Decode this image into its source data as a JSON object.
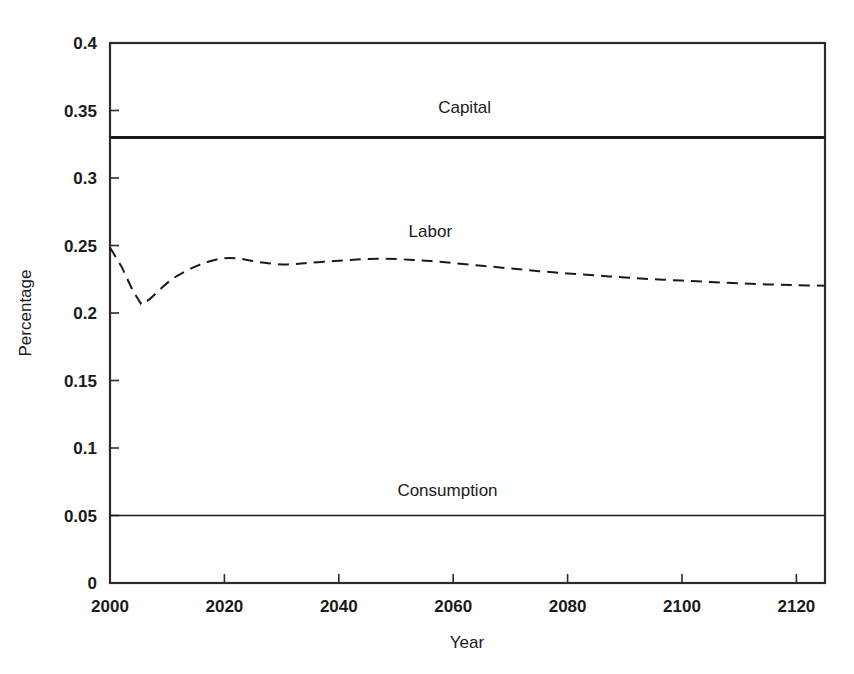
{
  "chart_data": {
    "type": "line",
    "title": "",
    "xlabel": "Year",
    "ylabel": "Percentage",
    "xlim": [
      2000,
      2125
    ],
    "ylim": [
      0,
      0.4
    ],
    "grid": false,
    "legend": "inline-labels",
    "xticks": [
      2000,
      2020,
      2040,
      2060,
      2080,
      2100,
      2120
    ],
    "xticklabels": [
      "2000",
      "2020",
      "2040",
      "2060",
      "2080",
      "2100",
      "2120"
    ],
    "yticks": [
      0,
      0.05,
      0.1,
      0.15,
      0.2,
      0.25,
      0.3,
      0.35,
      0.4
    ],
    "yticklabels": [
      "0",
      "0.05",
      "0.1",
      "0.15",
      "0.2",
      "0.25",
      "0.3",
      "0.35",
      "0.4"
    ],
    "series": [
      {
        "name": "Capital",
        "style": "solid",
        "line_width": 3.2,
        "color": "#1a1a1a",
        "label_x": 2062,
        "label_y": 0.348,
        "x": [
          2000,
          2125
        ],
        "values": [
          0.33,
          0.33
        ]
      },
      {
        "name": "Labor",
        "style": "dashed",
        "line_width": 2.0,
        "color": "#1a1a1a",
        "label_x": 2056,
        "label_y": 0.256,
        "x": [
          2000,
          2002,
          2004,
          2005.5,
          2007,
          2009,
          2011,
          2013,
          2015,
          2017,
          2019,
          2021,
          2023,
          2025,
          2027,
          2029,
          2031,
          2033,
          2035,
          2038,
          2041,
          2044,
          2047,
          2050,
          2053,
          2056,
          2060,
          2065,
          2070,
          2075,
          2080,
          2085,
          2090,
          2095,
          2100,
          2105,
          2110,
          2115,
          2120,
          2125
        ],
        "values": [
          0.2485,
          0.2345,
          0.2165,
          0.2062,
          0.2105,
          0.2185,
          0.2255,
          0.2305,
          0.2345,
          0.2378,
          0.24,
          0.2408,
          0.24,
          0.2385,
          0.2372,
          0.2363,
          0.236,
          0.2365,
          0.2372,
          0.2382,
          0.239,
          0.2398,
          0.2402,
          0.24,
          0.2393,
          0.2385,
          0.237,
          0.235,
          0.233,
          0.231,
          0.2293,
          0.2278,
          0.2263,
          0.225,
          0.224,
          0.223,
          0.222,
          0.2212,
          0.2206,
          0.2202
        ]
      },
      {
        "name": "Consumption",
        "style": "solid",
        "line_width": 1.7,
        "color": "#1a1a1a",
        "label_x": 2059,
        "label_y": 0.0645,
        "x": [
          2000,
          2125
        ],
        "values": [
          0.05,
          0.05
        ]
      }
    ]
  },
  "figure": {
    "background_color": "#ffffff",
    "axis_color": "#2b2b2b"
  }
}
